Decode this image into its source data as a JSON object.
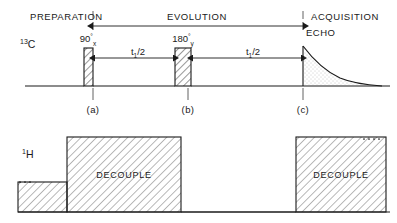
{
  "figure": {
    "type": "nmr-pulse-sequence-diagram"
  },
  "headers": [
    {
      "label": "PREPARATION",
      "x": 30
    },
    {
      "label": "EVOLUTION",
      "x": 197
    },
    {
      "label": "ACQUISITION",
      "x": 311
    }
  ],
  "channels": {
    "carbon": {
      "name": "13C",
      "superscript": "13",
      "base": "C"
    },
    "proton": {
      "name": "1H",
      "superscript": "1",
      "base": "H"
    }
  },
  "pulses": [
    {
      "id": "pulse-90",
      "angle": "90",
      "degree_symbol": "°",
      "phase": "x",
      "x": 84,
      "width": 9,
      "height": 38
    },
    {
      "id": "pulse-180",
      "angle": "180",
      "degree_symbol": "°",
      "phase": "y",
      "x": 175,
      "width": 16,
      "height": 38
    }
  ],
  "intervals": [
    {
      "id": "t1-half-first",
      "label": "t",
      "subscript": "1",
      "suffix": "/2",
      "x": 138
    },
    {
      "id": "t1-half-second",
      "label": "t",
      "subscript": "1",
      "suffix": "/2",
      "x": 253
    }
  ],
  "markers": [
    {
      "label": "(a)",
      "x": 93
    },
    {
      "label": "(b)",
      "x": 188
    },
    {
      "label": "(c)",
      "x": 303
    }
  ],
  "echo": {
    "label": "ECHO",
    "x": 308,
    "y": 35
  },
  "decouple_blocks": [
    {
      "label": "DECOUPLE",
      "x": 67,
      "width": 114
    },
    {
      "label": "DECOUPLE",
      "x": 296,
      "width": 90
    }
  ],
  "colors": {
    "ink": "#1a1a1a",
    "background": "#ffffff",
    "hatch": "#1a1a1a",
    "stipple": "#8a8a8a"
  }
}
